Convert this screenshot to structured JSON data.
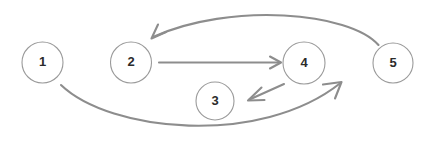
{
  "diagram": {
    "background_color": "#ffffff",
    "node_stroke_color": "#9a9a9a",
    "node_fill_color": "#ffffff",
    "node_label_color": "#2b2b2b",
    "edge_color": "#8d8d8d",
    "nodes": [
      {
        "id": "1",
        "label": "1",
        "cx": 42.5,
        "cy": 62.5,
        "r": 20.5
      },
      {
        "id": "2",
        "label": "2",
        "cx": 131.0,
        "cy": 62.5,
        "r": 20.5
      },
      {
        "id": "3",
        "label": "3",
        "cx": 215.0,
        "cy": 101.0,
        "r": 19.0
      },
      {
        "id": "4",
        "label": "4",
        "cx": 304.0,
        "cy": 63.0,
        "r": 21.0
      },
      {
        "id": "5",
        "label": "5",
        "cx": 393.0,
        "cy": 63.0,
        "r": 20.0
      }
    ],
    "edges": [
      {
        "id": "edge-2-to-4",
        "from": "2",
        "to": "4",
        "shape": "straight",
        "path": "M 159 62.5 L 280 62.5",
        "arrowhead": "M 270 56.5 L 281 62.5 L 270 68.5"
      },
      {
        "id": "edge-4-to-3",
        "from": "4",
        "to": "3",
        "shape": "straight",
        "path": "M 284 84 L 249.5 99.5",
        "arrowhead": "M 261.5 87.5 L 248 100.5 L 264.5 100"
      },
      {
        "id": "edge-5-to-2",
        "from": "5",
        "to": "2",
        "shape": "curve-over-top",
        "path": "M 378.5 45 C 350 12, 230 2, 153 37",
        "arrowhead": "M 166 32 L 151.5 38.5 L 158 24.5"
      },
      {
        "id": "edge-1-to-5",
        "from": "1",
        "to": "5",
        "shape": "curve-under-bottom",
        "path": "M 61 85 C 110 132, 260 147, 340.5 83",
        "arrowhead": "M 323 84.5 L 341.5 82 L 335 98.5"
      }
    ]
  }
}
